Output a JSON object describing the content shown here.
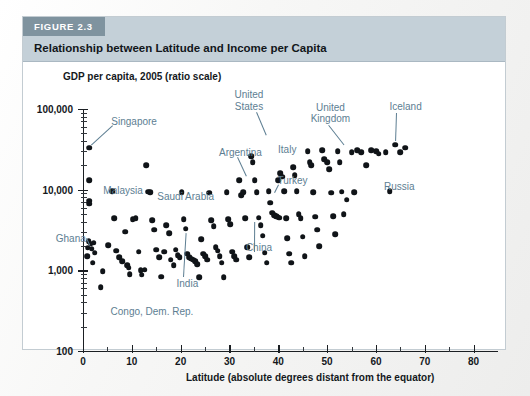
{
  "figure": {
    "tag": "FIGURE 2.3",
    "title": "Relationship between Latitude and Income per Capita"
  },
  "colors": {
    "header_band": "#c4d0d8",
    "tag_band": "#7f939f",
    "annotation": "#5d7e92",
    "dot": "#101418",
    "page": "#f7f7f6"
  },
  "chart_data": {
    "type": "scatter",
    "title": "GDP per capita, 2005 (ratio scale)",
    "xlabel": "Latitude (absolute degrees distant from the equator)",
    "ylabel": "GDP per capita, 2005 (ratio scale)",
    "xlim": [
      0,
      85
    ],
    "ylim": [
      100,
      100000
    ],
    "yscale": "log",
    "grid": false,
    "legend": "none",
    "xticks": [
      0,
      10,
      20,
      30,
      40,
      50,
      60,
      70,
      80
    ],
    "xminor_ticks": [
      5,
      15,
      25,
      35,
      45,
      55,
      65,
      75
    ],
    "yticks": [
      100,
      1000,
      10000,
      100000
    ],
    "ytick_labels": [
      "100",
      "1,000",
      "10,000",
      "100,000"
    ],
    "points": [
      [
        1.3,
        33000
      ],
      [
        1.3,
        13000
      ],
      [
        1.3,
        7300
      ],
      [
        1.3,
        6700
      ],
      [
        1.2,
        2300
      ],
      [
        1.6,
        2150
      ],
      [
        1.0,
        1900
      ],
      [
        1.8,
        1850
      ],
      [
        2.2,
        2200
      ],
      [
        2.4,
        1650
      ],
      [
        0.9,
        1500
      ],
      [
        2.0,
        1250
      ],
      [
        3.6,
        620
      ],
      [
        4.0,
        980
      ],
      [
        5.2,
        2050
      ],
      [
        6.0,
        9500
      ],
      [
        6.4,
        4400
      ],
      [
        6.8,
        1750
      ],
      [
        7.4,
        1450
      ],
      [
        8.0,
        1300
      ],
      [
        8.6,
        3000
      ],
      [
        9.0,
        1150
      ],
      [
        9.4,
        1080
      ],
      [
        9.6,
        900
      ],
      [
        10.2,
        4300
      ],
      [
        10.8,
        4400
      ],
      [
        11.4,
        1700
      ],
      [
        11.8,
        1000
      ],
      [
        12.0,
        880
      ],
      [
        12.6,
        1020
      ],
      [
        13.0,
        20000
      ],
      [
        13.4,
        9400
      ],
      [
        13.8,
        9300
      ],
      [
        14.2,
        4200
      ],
      [
        14.6,
        3200
      ],
      [
        15.0,
        1800
      ],
      [
        15.6,
        1450
      ],
      [
        16.0,
        830
      ],
      [
        16.6,
        1700
      ],
      [
        17.0,
        3600
      ],
      [
        17.6,
        2900
      ],
      [
        18.0,
        1350
      ],
      [
        18.6,
        1150
      ],
      [
        19.0,
        1800
      ],
      [
        19.4,
        1550
      ],
      [
        19.8,
        1450
      ],
      [
        20.2,
        9300
      ],
      [
        20.6,
        4300
      ],
      [
        21.0,
        3300
      ],
      [
        21.4,
        1600
      ],
      [
        21.8,
        1450
      ],
      [
        22.2,
        1400
      ],
      [
        22.6,
        1350
      ],
      [
        23.0,
        1300
      ],
      [
        23.4,
        1200
      ],
      [
        23.8,
        820
      ],
      [
        24.2,
        2450
      ],
      [
        24.6,
        1600
      ],
      [
        25.0,
        1500
      ],
      [
        25.4,
        1350
      ],
      [
        25.8,
        9200
      ],
      [
        26.2,
        4200
      ],
      [
        26.8,
        3500
      ],
      [
        27.2,
        1950
      ],
      [
        27.6,
        1750
      ],
      [
        28.0,
        1500
      ],
      [
        28.4,
        1250
      ],
      [
        28.8,
        820
      ],
      [
        29.4,
        9300
      ],
      [
        29.8,
        4300
      ],
      [
        30.2,
        3700
      ],
      [
        30.6,
        1700
      ],
      [
        31.0,
        1500
      ],
      [
        31.4,
        1350
      ],
      [
        32.0,
        13000
      ],
      [
        32.4,
        8500
      ],
      [
        32.8,
        9300
      ],
      [
        33.2,
        4400
      ],
      [
        33.6,
        1950
      ],
      [
        34.0,
        1450
      ],
      [
        34.4,
        26000
      ],
      [
        34.8,
        22000
      ],
      [
        35.2,
        13000
      ],
      [
        35.6,
        9300
      ],
      [
        36.0,
        4500
      ],
      [
        36.4,
        3600
      ],
      [
        36.8,
        2700
      ],
      [
        37.2,
        1650
      ],
      [
        37.6,
        1250
      ],
      [
        38.0,
        9500
      ],
      [
        38.4,
        6900
      ],
      [
        38.8,
        5200
      ],
      [
        39.2,
        4800
      ],
      [
        39.6,
        4700
      ],
      [
        39.8,
        4600
      ],
      [
        40.2,
        4500
      ],
      [
        40.0,
        13000
      ],
      [
        40.4,
        16000
      ],
      [
        40.8,
        14500
      ],
      [
        41.2,
        9500
      ],
      [
        41.6,
        4400
      ],
      [
        41.8,
        2500
      ],
      [
        42.2,
        1600
      ],
      [
        42.6,
        1250
      ],
      [
        43.0,
        19000
      ],
      [
        43.4,
        15000
      ],
      [
        43.8,
        9500
      ],
      [
        44.2,
        5000
      ],
      [
        44.6,
        4400
      ],
      [
        45.0,
        2600
      ],
      [
        45.4,
        1500
      ],
      [
        46.0,
        30000
      ],
      [
        46.4,
        22000
      ],
      [
        46.8,
        20000
      ],
      [
        47.2,
        9300
      ],
      [
        47.6,
        4600
      ],
      [
        48.0,
        3200
      ],
      [
        48.4,
        2000
      ],
      [
        49.0,
        31000
      ],
      [
        49.4,
        24000
      ],
      [
        50.0,
        22000
      ],
      [
        50.4,
        18000
      ],
      [
        50.8,
        9200
      ],
      [
        51.2,
        4700
      ],
      [
        51.6,
        2800
      ],
      [
        52.2,
        30000
      ],
      [
        52.6,
        22000
      ],
      [
        53.0,
        9400
      ],
      [
        53.4,
        5000
      ],
      [
        54.0,
        7500
      ],
      [
        55.0,
        29000
      ],
      [
        55.6,
        9300
      ],
      [
        56.2,
        31000
      ],
      [
        57.0,
        29000
      ],
      [
        58.0,
        20000
      ],
      [
        59.0,
        31000
      ],
      [
        60.0,
        30000
      ],
      [
        60.6,
        28000
      ],
      [
        62.0,
        29000
      ],
      [
        62.8,
        9600
      ],
      [
        64.0,
        36000
      ],
      [
        65.0,
        29000
      ],
      [
        66.0,
        33000
      ]
    ],
    "annotations": [
      {
        "label": "Singapore",
        "x": 1.3,
        "y": 33000,
        "leader": true
      },
      {
        "label": "Malaysia",
        "x": 1.3,
        "y": 13000,
        "leader": false
      },
      {
        "label": "Ghana",
        "x": 1.8,
        "y": 1850,
        "leader": true
      },
      {
        "label": "Congo, Dem. Rep.",
        "x": 3.6,
        "y": 620,
        "leader": false
      },
      {
        "label": "Saudi Arabia",
        "x": 23.0,
        "y": 13000,
        "leader": false
      },
      {
        "label": "India",
        "x": 21.0,
        "y": 3300,
        "leader": true
      },
      {
        "label": "Argentina",
        "x": 34.0,
        "y": 13000,
        "leader": true
      },
      {
        "label": "China",
        "x": 35.0,
        "y": 4400,
        "leader": true
      },
      {
        "label": "Turkey",
        "x": 39.0,
        "y": 8000,
        "leader": true
      },
      {
        "label": "Italy",
        "x": 42.0,
        "y": 28000,
        "leader": false
      },
      {
        "label": "United States",
        "x": 38.0,
        "y": 42000,
        "leader": true
      },
      {
        "label": "United Kingdom",
        "x": 54.0,
        "y": 33000,
        "leader": true
      },
      {
        "label": "Iceland",
        "x": 64.0,
        "y": 36000,
        "leader": true
      },
      {
        "label": "Russia",
        "x": 60.0,
        "y": 11000,
        "leader": false
      }
    ]
  }
}
